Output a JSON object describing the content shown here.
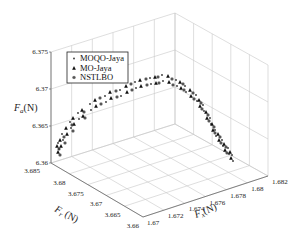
{
  "chart_data": {
    "type": "scatter3d",
    "title": "",
    "xlabel": "F_x(N)",
    "ylabel": "F_r(N)",
    "zlabel": "F_a(N)",
    "xlim": [
      1.67,
      1.682
    ],
    "ylim": [
      3.66,
      3.685
    ],
    "zlim": [
      6.36,
      6.375
    ],
    "xticks": [
      "1.67",
      "1.672",
      "1.674",
      "1.676",
      "1.678",
      "1.68",
      "1.682"
    ],
    "yticks": [
      "3.66",
      "3.665",
      "3.67",
      "3.675",
      "3.68",
      "3.685"
    ],
    "zticks": [
      "6.36",
      "6.365",
      "6.37",
      "6.375"
    ],
    "grid": true,
    "legend": {
      "position": "upper-left",
      "entries": [
        {
          "label": "MOQO-Jaya",
          "marker": "point"
        },
        {
          "label": "MO-Jaya",
          "marker": "triangle"
        },
        {
          "label": "NSTLBO",
          "marker": "asterisk"
        }
      ]
    },
    "series": [
      {
        "name": "MOQO-Jaya",
        "description": "Pareto front points forming an arch from low Fr/high Fx side up to peak Fa near 6.372 and back down",
        "points_screen": [
          [
            58,
            143
          ],
          [
            62,
            134
          ],
          [
            70,
            122
          ],
          [
            78,
            113
          ],
          [
            90,
            104
          ],
          [
            105,
            96
          ],
          [
            120,
            90
          ],
          [
            135,
            82
          ],
          [
            150,
            78
          ],
          [
            162,
            75
          ],
          [
            176,
            80
          ],
          [
            185,
            86
          ],
          [
            196,
            95
          ],
          [
            203,
            105
          ],
          [
            210,
            118
          ],
          [
            215,
            130
          ],
          [
            222,
            140
          ],
          [
            228,
            148
          ],
          [
            232,
            155
          ]
        ]
      },
      {
        "name": "MO-Jaya",
        "description": "Pareto front points overlapping the same arch",
        "points_screen": [
          [
            57,
            146
          ],
          [
            60,
            140
          ],
          [
            66,
            128
          ],
          [
            73,
            118
          ],
          [
            82,
            110
          ],
          [
            95,
            100
          ],
          [
            110,
            92
          ],
          [
            126,
            86
          ],
          [
            140,
            80
          ],
          [
            155,
            77
          ],
          [
            168,
            76
          ],
          [
            180,
            82
          ],
          [
            190,
            90
          ],
          [
            199,
            100
          ],
          [
            206,
            112
          ],
          [
            212,
            124
          ],
          [
            218,
            134
          ],
          [
            224,
            144
          ],
          [
            230,
            152
          ]
        ]
      },
      {
        "name": "NSTLBO",
        "description": "Pareto front points overlapping the same arch",
        "points_screen": [
          [
            59,
            149
          ],
          [
            64,
            137
          ],
          [
            72,
            125
          ],
          [
            84,
            112
          ],
          [
            100,
            98
          ],
          [
            116,
            91
          ],
          [
            131,
            84
          ],
          [
            146,
            79
          ],
          [
            158,
            77
          ],
          [
            172,
            79
          ],
          [
            183,
            84
          ],
          [
            193,
            93
          ],
          [
            201,
            103
          ],
          [
            208,
            115
          ],
          [
            214,
            127
          ],
          [
            220,
            137
          ],
          [
            226,
            147
          ]
        ]
      }
    ]
  }
}
